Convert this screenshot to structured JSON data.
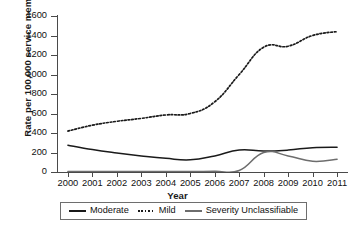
{
  "chart_data": {
    "type": "line",
    "title": "",
    "xlabel": "Year",
    "ylabel": "Rate per 100,000 service members",
    "categories": [
      "2000",
      "2001",
      "2002",
      "2003",
      "2004",
      "2005",
      "2006",
      "2007",
      "2008",
      "2009",
      "2010",
      "2011"
    ],
    "x": [
      2000,
      2001,
      2002,
      2003,
      2004,
      2005,
      2006,
      2007,
      2008,
      2009,
      2010,
      2011
    ],
    "xlim": [
      2000,
      2011
    ],
    "ylim": [
      0,
      1600
    ],
    "yticks": [
      0,
      200,
      400,
      600,
      800,
      1000,
      1200,
      1400,
      1600
    ],
    "ytick_labels": [
      "0",
      "200",
      "400",
      "600",
      "800",
      "1000",
      "1200",
      "1400",
      "1600"
    ],
    "grid": false,
    "legend_position": "below-axes",
    "series": [
      {
        "name": "Moderate",
        "style": "solid",
        "color": "#1a1a1a",
        "values": [
          275,
          230,
          195,
          165,
          140,
          125,
          165,
          225,
          215,
          225,
          250,
          255
        ]
      },
      {
        "name": "Mild",
        "style": "dotted",
        "color": "#1a1a1a",
        "values": [
          420,
          480,
          520,
          550,
          585,
          600,
          720,
          1000,
          1280,
          1290,
          1400,
          1440
        ]
      },
      {
        "name": "Severity Unclassifiable",
        "style": "solid",
        "color": "#6d6d6d",
        "values": [
          5,
          5,
          5,
          5,
          5,
          5,
          8,
          15,
          200,
          165,
          110,
          130
        ]
      }
    ]
  },
  "legend": {
    "entries": [
      {
        "label": "Moderate",
        "swatch": "solid-dark"
      },
      {
        "label": "Mild",
        "swatch": "dotted"
      },
      {
        "label": "Severity Unclassifiable",
        "swatch": "solid-gray"
      }
    ]
  },
  "axes": {
    "x_title": "Year",
    "y_title": "Rate per 100,000 service members"
  }
}
